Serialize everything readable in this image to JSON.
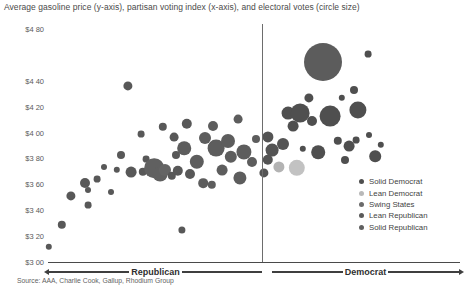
{
  "title": "Average gasoline price (y-axis), partisan voting index (x-axis), and electoral votes (circle size)",
  "source": "Source: AAA, Charlie Cook, Gallup, Rhodium Group",
  "axis": {
    "left_label": "Republican",
    "right_label": "Democrat"
  },
  "legend": {
    "items": [
      {
        "label": "Solid Democrat",
        "color": "#4f4f4f"
      },
      {
        "label": "Lean Democrat",
        "color": "#b9b9b9"
      },
      {
        "label": "Swing States",
        "color": "#6b6b6b"
      },
      {
        "label": "Lean Republican",
        "color": "#5a5a5a"
      },
      {
        "label": "Solid Republican",
        "color": "#606060"
      }
    ]
  },
  "chart_data": {
    "type": "scatter",
    "title": "Average gasoline price (y-axis), partisan voting index (x-axis), and electoral votes (circle size)",
    "xlabel": "Partisan voting index",
    "ylabel": "Average gasoline price",
    "ylim": [
      3.0,
      4.8
    ],
    "yticks": [
      "$4 80",
      "$4 40",
      "$4 20",
      "$4 00",
      "$3 80",
      "$3 60",
      "$3 40",
      "$3 20",
      "$3 00"
    ],
    "ytick_values": [
      4.8,
      4.4,
      4.2,
      4.0,
      3.8,
      3.6,
      3.4,
      3.2,
      3.0
    ],
    "grid": false,
    "legend_position": "bottom-right",
    "size_encoding": "electoral votes",
    "center_divider_x": 0,
    "series": [
      {
        "name": "Solid Republican",
        "color": "#5f5f5f"
      },
      {
        "name": "Lean Republican",
        "color": "#585858"
      },
      {
        "name": "Swing States",
        "color": "#6b6b6b"
      },
      {
        "name": "Lean Democrat",
        "color": "#b9b9b9"
      },
      {
        "name": "Solid Democrat",
        "color": "#4f4f4f"
      }
    ],
    "points": [
      {
        "px": 62,
        "py": 225,
        "r": 4.2,
        "color": "#585858",
        "series": "Solid Republican"
      },
      {
        "px": 49,
        "py": 247,
        "r": 3.2,
        "color": "#585858",
        "series": "Solid Republican"
      },
      {
        "px": 71,
        "py": 196,
        "r": 4.6,
        "color": "#585858",
        "series": "Solid Republican"
      },
      {
        "px": 88,
        "py": 205,
        "r": 3.4,
        "color": "#585858",
        "series": "Solid Republican"
      },
      {
        "px": 88,
        "py": 190,
        "r": 3.0,
        "color": "#585858",
        "series": "Solid Republican"
      },
      {
        "px": 85,
        "py": 183,
        "r": 5.0,
        "color": "#585858",
        "series": "Solid Republican"
      },
      {
        "px": 97,
        "py": 179,
        "r": 3.4,
        "color": "#585858",
        "series": "Solid Republican"
      },
      {
        "px": 121,
        "py": 155,
        "r": 4.0,
        "color": "#585858",
        "series": "Solid Republican"
      },
      {
        "px": 117,
        "py": 170,
        "r": 3.2,
        "color": "#585858",
        "series": "Solid Republican"
      },
      {
        "px": 104,
        "py": 167,
        "r": 3.0,
        "color": "#585858",
        "series": "Solid Republican"
      },
      {
        "px": 128,
        "py": 86,
        "r": 4.6,
        "color": "#585858",
        "series": "Solid Republican"
      },
      {
        "px": 131,
        "py": 172,
        "r": 5.4,
        "color": "#585858",
        "series": "Solid Republican"
      },
      {
        "px": 143,
        "py": 172,
        "r": 4.2,
        "color": "#585858",
        "series": "Solid Republican"
      },
      {
        "px": 146,
        "py": 159,
        "r": 3.4,
        "color": "#585858",
        "series": "Solid Republican"
      },
      {
        "px": 154,
        "py": 168,
        "r": 9.8,
        "color": "#606060",
        "series": "Solid Republican"
      },
      {
        "px": 160,
        "py": 174,
        "r": 7.4,
        "color": "#606060",
        "series": "Lean Republican"
      },
      {
        "px": 165,
        "py": 170,
        "r": 6.0,
        "color": "#646464",
        "series": "Lean Republican"
      },
      {
        "px": 172,
        "py": 176,
        "r": 4.2,
        "color": "#585858",
        "series": "Lean Republican"
      },
      {
        "px": 178,
        "py": 171,
        "r": 5.2,
        "color": "#585858",
        "series": "Lean Republican"
      },
      {
        "px": 176,
        "py": 155,
        "r": 4.0,
        "color": "#585858",
        "series": "Lean Republican"
      },
      {
        "px": 184,
        "py": 148,
        "r": 6.8,
        "color": "#5d5d5d",
        "series": "Lean Republican"
      },
      {
        "px": 187,
        "py": 124,
        "r": 5.2,
        "color": "#585858",
        "series": "Lean Republican"
      },
      {
        "px": 174,
        "py": 137,
        "r": 4.4,
        "color": "#585858",
        "series": "Lean Republican"
      },
      {
        "px": 182,
        "py": 230,
        "r": 3.6,
        "color": "#585858",
        "series": "Solid Republican"
      },
      {
        "px": 197,
        "py": 162,
        "r": 7.2,
        "color": "#5d5d5d",
        "series": "Lean Republican"
      },
      {
        "px": 190,
        "py": 174,
        "r": 5.0,
        "color": "#585858",
        "series": "Lean Republican"
      },
      {
        "px": 205,
        "py": 138,
        "r": 6.0,
        "color": "#5d5d5d",
        "series": "Swing States"
      },
      {
        "px": 213,
        "py": 126,
        "r": 5.0,
        "color": "#5d5d5d",
        "series": "Swing States"
      },
      {
        "px": 216,
        "py": 148,
        "r": 8.4,
        "color": "#5d5d5d",
        "series": "Swing States"
      },
      {
        "px": 228,
        "py": 141,
        "r": 7.0,
        "color": "#5d5d5d",
        "series": "Swing States"
      },
      {
        "px": 231,
        "py": 157,
        "r": 6.2,
        "color": "#5d5d5d",
        "series": "Swing States"
      },
      {
        "px": 222,
        "py": 170,
        "r": 5.4,
        "color": "#5d5d5d",
        "series": "Swing States"
      },
      {
        "px": 240,
        "py": 178,
        "r": 6.6,
        "color": "#5d5d5d",
        "series": "Swing States"
      },
      {
        "px": 244,
        "py": 152,
        "r": 7.6,
        "color": "#5d5d5d",
        "series": "Swing States"
      },
      {
        "px": 252,
        "py": 162,
        "r": 5.0,
        "color": "#5d5d5d",
        "series": "Swing States"
      },
      {
        "px": 256,
        "py": 139,
        "r": 4.0,
        "color": "#5d5d5d",
        "series": "Swing States"
      },
      {
        "px": 268,
        "py": 137,
        "r": 5.6,
        "color": "#545454",
        "series": "Lean Democrat"
      },
      {
        "px": 272,
        "py": 150,
        "r": 6.4,
        "color": "#545454",
        "series": "Lean Democrat"
      },
      {
        "px": 268,
        "py": 160,
        "r": 5.2,
        "color": "#545454",
        "series": "Lean Democrat"
      },
      {
        "px": 264,
        "py": 173,
        "r": 4.6,
        "color": "#545454",
        "series": "Lean Democrat"
      },
      {
        "px": 279,
        "py": 167,
        "r": 5.6,
        "color": "#b3b3b3",
        "series": "Lean Democrat"
      },
      {
        "px": 283,
        "py": 144,
        "r": 6.0,
        "color": "#545454",
        "series": "Lean Democrat"
      },
      {
        "px": 297,
        "py": 168,
        "r": 8.2,
        "color": "#c2c2c2",
        "series": "Lean Democrat"
      },
      {
        "px": 293,
        "py": 126,
        "r": 5.4,
        "color": "#4f4f4f",
        "series": "Solid Democrat"
      },
      {
        "px": 288,
        "py": 113,
        "r": 6.4,
        "color": "#4f4f4f",
        "series": "Solid Democrat"
      },
      {
        "px": 300,
        "py": 113,
        "r": 9.4,
        "color": "#4f4f4f",
        "series": "Solid Democrat"
      },
      {
        "px": 312,
        "py": 121,
        "r": 5.0,
        "color": "#4f4f4f",
        "series": "Solid Democrat"
      },
      {
        "px": 323,
        "py": 62,
        "r": 19.0,
        "color": "#5c5c5c",
        "series": "Solid Democrat"
      },
      {
        "px": 330,
        "py": 116,
        "r": 10.4,
        "color": "#4f4f4f",
        "series": "Solid Democrat"
      },
      {
        "px": 318,
        "py": 152,
        "r": 6.8,
        "color": "#4f4f4f",
        "series": "Solid Democrat"
      },
      {
        "px": 338,
        "py": 141,
        "r": 4.2,
        "color": "#4f4f4f",
        "series": "Solid Democrat"
      },
      {
        "px": 349,
        "py": 146,
        "r": 5.4,
        "color": "#4f4f4f",
        "series": "Solid Democrat"
      },
      {
        "px": 356,
        "py": 140,
        "r": 3.4,
        "color": "#4f4f4f",
        "series": "Solid Democrat"
      },
      {
        "px": 345,
        "py": 160,
        "r": 4.0,
        "color": "#4f4f4f",
        "series": "Solid Democrat"
      },
      {
        "px": 358,
        "py": 110,
        "r": 8.6,
        "color": "#4f4f4f",
        "series": "Solid Democrat"
      },
      {
        "px": 354,
        "py": 90,
        "r": 4.0,
        "color": "#4f4f4f",
        "series": "Solid Democrat"
      },
      {
        "px": 342,
        "py": 98,
        "r": 3.2,
        "color": "#4f4f4f",
        "series": "Solid Democrat"
      },
      {
        "px": 368,
        "py": 54,
        "r": 3.4,
        "color": "#4f4f4f",
        "series": "Solid Democrat"
      },
      {
        "px": 369,
        "py": 135,
        "r": 3.0,
        "color": "#4f4f4f",
        "series": "Solid Democrat"
      },
      {
        "px": 381,
        "py": 145,
        "r": 3.2,
        "color": "#4f4f4f",
        "series": "Solid Democrat"
      },
      {
        "px": 375,
        "py": 156,
        "r": 5.8,
        "color": "#4f4f4f",
        "series": "Solid Democrat"
      },
      {
        "px": 309,
        "py": 98,
        "r": 4.6,
        "color": "#4f4f4f",
        "series": "Solid Democrat"
      },
      {
        "px": 303,
        "py": 149,
        "r": 3.2,
        "color": "#4f4f4f",
        "series": "Solid Democrat"
      },
      {
        "px": 238,
        "py": 119,
        "r": 4.4,
        "color": "#5d5d5d",
        "series": "Swing States"
      },
      {
        "px": 203,
        "py": 183,
        "r": 4.8,
        "color": "#5d5d5d",
        "series": "Lean Republican"
      },
      {
        "px": 212,
        "py": 185,
        "r": 4.2,
        "color": "#5d5d5d",
        "series": "Lean Republican"
      },
      {
        "px": 163,
        "py": 127,
        "r": 4.2,
        "color": "#585858",
        "series": "Lean Republican"
      },
      {
        "px": 141,
        "py": 134,
        "r": 3.4,
        "color": "#585858",
        "series": "Solid Republican"
      },
      {
        "px": 111,
        "py": 192,
        "r": 3.0,
        "color": "#585858",
        "series": "Solid Republican"
      }
    ]
  }
}
